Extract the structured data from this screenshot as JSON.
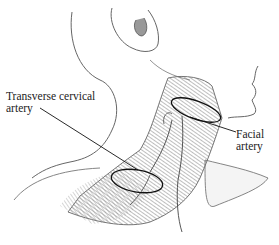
{
  "figure": {
    "labels": {
      "transverse_cervical": {
        "line1": "Transverse cervical",
        "line2": "artery"
      },
      "facial": {
        "line1": "Facial",
        "line2": "artery"
      }
    },
    "colors": {
      "background": "#ffffff",
      "outline": "#555555",
      "muscle": "#7a7a7a",
      "leader": "#111111"
    }
  }
}
